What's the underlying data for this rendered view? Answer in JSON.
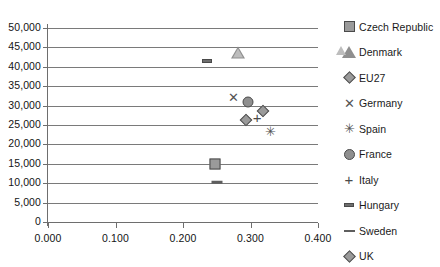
{
  "chart_data": {
    "type": "scatter",
    "title": "",
    "xlabel": "",
    "ylabel": "",
    "xlim": [
      0.0,
      0.4
    ],
    "ylim": [
      0,
      50000
    ],
    "grid": true,
    "legend_position": "right",
    "x_ticks": [
      "0.000",
      "0.100",
      "0.200",
      "0.300",
      "0.400"
    ],
    "x_tick_values": [
      0.0,
      0.1,
      0.2,
      0.3,
      0.4
    ],
    "y_ticks": [
      "0",
      "5,000",
      "10,000",
      "15,000",
      "20,000",
      "25,000",
      "30,000",
      "35,000",
      "40,000",
      "45,000",
      "50,000"
    ],
    "y_tick_values": [
      0,
      5000,
      10000,
      15000,
      20000,
      25000,
      30000,
      35000,
      40000,
      45000,
      50000
    ],
    "series": [
      {
        "name": "Czech Republic",
        "marker": "square",
        "x": 0.248,
        "y": 14900
      },
      {
        "name": "Denmark",
        "marker": "triangle",
        "x": 0.281,
        "y": 43500
      },
      {
        "name": "EU27",
        "marker": "diamond",
        "x": 0.294,
        "y": 26200
      },
      {
        "name": "Germany",
        "marker": "x-cross",
        "x": 0.275,
        "y": 31900
      },
      {
        "name": "Spain",
        "marker": "star-cross",
        "x": 0.33,
        "y": 23100
      },
      {
        "name": "France",
        "marker": "circle",
        "x": 0.297,
        "y": 30800
      },
      {
        "name": "Italy",
        "marker": "plus",
        "x": 0.31,
        "y": 26700
      },
      {
        "name": "Hungary",
        "marker": "dash-small",
        "x": 0.236,
        "y": 41500
      },
      {
        "name": "Sweden",
        "marker": "dash-wide",
        "x": 0.25,
        "y": 10200
      },
      {
        "name": "UK",
        "marker": "diamond",
        "x": 0.318,
        "y": 28600
      }
    ]
  },
  "legend": {
    "items": [
      {
        "label": "Czech Republic",
        "marker": "square"
      },
      {
        "label": "Denmark",
        "marker": "triangle"
      },
      {
        "label": "EU27",
        "marker": "diamond"
      },
      {
        "label": "Germany",
        "marker": "x-cross"
      },
      {
        "label": "Spain",
        "marker": "star-cross"
      },
      {
        "label": "France",
        "marker": "circle"
      },
      {
        "label": "Italy",
        "marker": "plus"
      },
      {
        "label": "Hungary",
        "marker": "dash-small"
      },
      {
        "label": "Sweden",
        "marker": "dash-wide"
      },
      {
        "label": "UK",
        "marker": "diamond"
      }
    ]
  },
  "colors": {
    "axis": "#6e6e6e",
    "grid": "#7a7a7a",
    "marker_fill": "#9a9a9a",
    "marker_stroke": "#4a4a4a",
    "text": "#1a1a1a",
    "background": "#ffffff"
  }
}
